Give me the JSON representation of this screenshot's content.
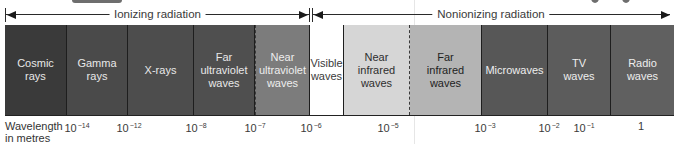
{
  "diagram": {
    "ranges": [
      {
        "id": "ionizing",
        "label": "Ionizing radiation",
        "x_start": 5,
        "x_end": 310
      },
      {
        "id": "nonionizing",
        "label": "Nonionizing radiation",
        "x_start": 312,
        "x_end": 670
      }
    ],
    "bands": [
      {
        "id": "cosmic",
        "label": "Cosmic\nrays",
        "x": 0,
        "w": 62,
        "bg": "#3a3a3a",
        "fg": "#e8e8e8"
      },
      {
        "id": "gamma",
        "label": "Gamma\nrays",
        "x": 62,
        "w": 61,
        "bg": "#4a4a4a",
        "fg": "#e8e8e8"
      },
      {
        "id": "xrays",
        "label": "X-rays",
        "x": 123,
        "w": 66,
        "bg": "#4d4d4d",
        "fg": "#e8e8e8"
      },
      {
        "id": "far-uv",
        "label": "Far\nultraviolet\nwaves",
        "x": 189,
        "w": 61,
        "bg": "#4f4f4f",
        "fg": "#e8e8e8"
      },
      {
        "id": "near-uv",
        "label": "Near\nultraviolet\nwaves",
        "x": 250,
        "w": 55,
        "bg": "#7c7c7c",
        "fg": "#eeeeee",
        "dashed_left": true
      },
      {
        "id": "visible",
        "label": "Visible\nwaves",
        "x": 305,
        "w": 34,
        "bg": "#ffffff",
        "fg": "#3a3a3a"
      },
      {
        "id": "near-ir",
        "label": "Near\ninfrared\nwaves",
        "x": 339,
        "w": 66,
        "bg": "#d6d6d6",
        "fg": "#2e2e2e",
        "dashed_right": true
      },
      {
        "id": "far-ir",
        "label": "Far\ninfrared\nwaves",
        "x": 405,
        "w": 72,
        "bg": "#b4b4b4",
        "fg": "#1e1e1e"
      },
      {
        "id": "microwaves",
        "label": "Microwaves",
        "x": 477,
        "w": 66,
        "bg": "#575757",
        "fg": "#eeeeee"
      },
      {
        "id": "tv",
        "label": "TV\nwaves",
        "x": 543,
        "w": 63,
        "bg": "#5c5c5c",
        "fg": "#eeeeee"
      },
      {
        "id": "radio",
        "label": "Radio\nwaves",
        "x": 606,
        "w": 63,
        "bg": "#606060",
        "fg": "#eeeeee"
      }
    ],
    "axis": {
      "title": "Wavelength\nin metres",
      "ticks": [
        {
          "base": "10",
          "exp": "−14",
          "x": 77
        },
        {
          "base": "10",
          "exp": "−12",
          "x": 129
        },
        {
          "base": "10",
          "exp": "−8",
          "x": 196
        },
        {
          "base": "10",
          "exp": "−7",
          "x": 255
        },
        {
          "base": "10",
          "exp": "−6",
          "x": 311
        },
        {
          "base": "10",
          "exp": "−5",
          "x": 388
        },
        {
          "base": "10",
          "exp": "−3",
          "x": 485
        },
        {
          "base": "10",
          "exp": "−2",
          "x": 549
        },
        {
          "base": "10",
          "exp": "−1",
          "x": 584
        },
        {
          "base": "1",
          "exp": "",
          "x": 641
        }
      ]
    }
  }
}
